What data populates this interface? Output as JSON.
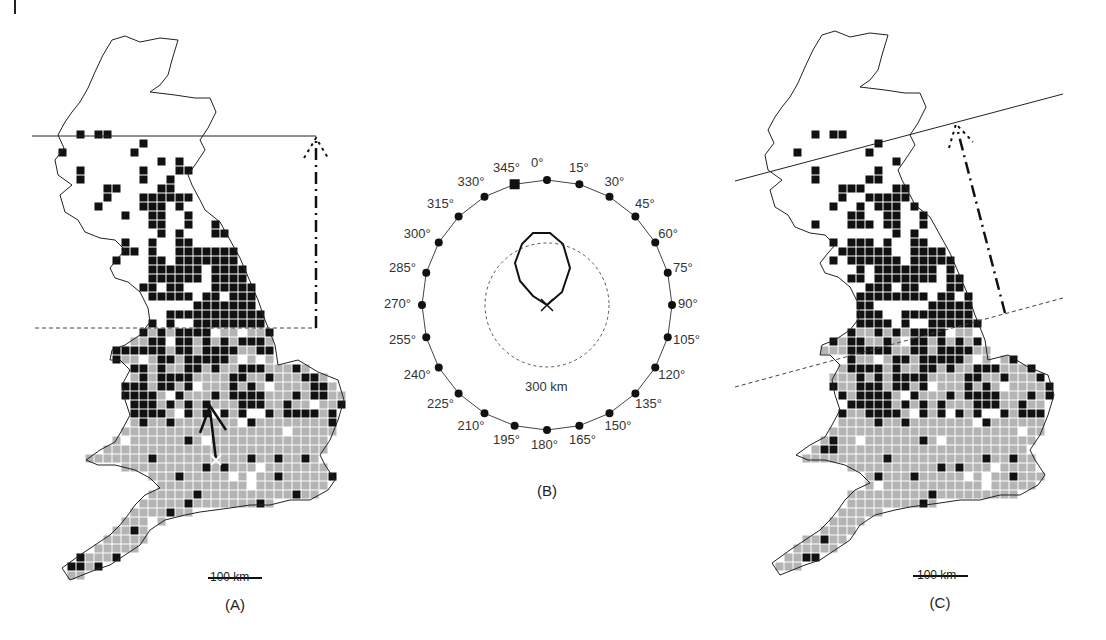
{
  "panels": {
    "a": {
      "label": "(A)",
      "scale_label": "100 km"
    },
    "b": {
      "label": "(B)",
      "radius_label": "300 km"
    },
    "c": {
      "label": "(C)",
      "scale_label": "100 km"
    }
  },
  "polar": {
    "ticks": [
      "0°",
      "15°",
      "30°",
      "45°",
      "60°",
      "75°",
      "90°",
      "105°",
      "120°",
      "135°",
      "150°",
      "165°",
      "180°",
      "195°",
      "210°",
      "225°",
      "240°",
      "255°",
      "270°",
      "285°",
      "300°",
      "315°",
      "330°",
      "345°"
    ],
    "selected_angle": "345°",
    "marker_center": "×"
  },
  "legend": {
    "black_squares": "occupied grid squares (recent)",
    "grey_squares": "occupied grid squares (earlier)",
    "colors": {
      "black": "#111111",
      "grey": "#b4b4b4",
      "outline": "#222222"
    }
  }
}
